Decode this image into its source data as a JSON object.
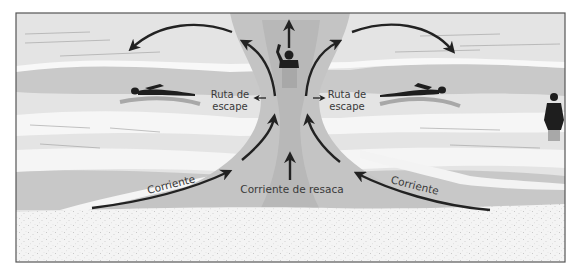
{
  "diagram": {
    "title": "Corriente de resaca",
    "colors": {
      "frame": "#555555",
      "water_light": "#e6e6e6",
      "water_mid": "#cfcfcf",
      "water_dark": "#bdbdbd",
      "foam": "#f7f7f7",
      "sand": "#f2f2f2",
      "arrow": "#222222",
      "figure": "#1e1e1e",
      "text": "#3a3a3a"
    },
    "labels": {
      "escape_left_line1": "Ruta de",
      "escape_left_line2": "escape",
      "escape_right_line1": "Ruta de",
      "escape_right_line2": "escape",
      "current_left": "Corriente",
      "current_right": "Corriente",
      "rip_current": "Corriente de resaca"
    },
    "figures": [
      {
        "id": "swimmer-left",
        "pose": "swimming toward left"
      },
      {
        "id": "swimmer-center",
        "pose": "waving for help in rip channel"
      },
      {
        "id": "swimmer-right",
        "pose": "swimming toward right"
      },
      {
        "id": "person-standing",
        "pose": "standing in shallow water"
      }
    ]
  }
}
